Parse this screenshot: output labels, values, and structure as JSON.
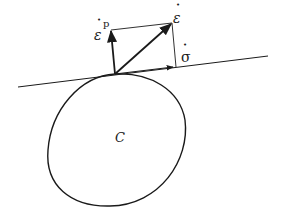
{
  "diagram": {
    "type": "yield-surface-normality",
    "colors": {
      "stroke": "#1a1a1a",
      "background": "#ffffff"
    },
    "labels": {
      "region": "C",
      "plastic_strain_rate": "ε",
      "plastic_strain_rate_sup": "p",
      "strain_rate": "ε",
      "stress_rate": "σ",
      "rate_dot": "•"
    },
    "elements": [
      "closed convex curve C",
      "tangent line at contact point",
      "vector ε̇ᵖ (normal to curve)",
      "vector ε̇ (diagonal)",
      "vector σ̇ (along tangent)",
      "parallelogram construction lines"
    ]
  }
}
